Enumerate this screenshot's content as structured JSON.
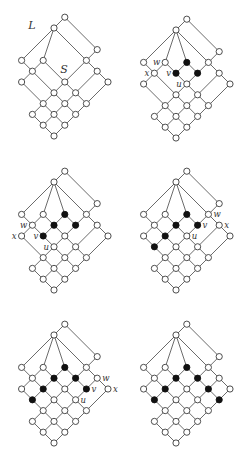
{
  "figure": {
    "diagrams": [
      {
        "id": "panel-1",
        "region_labels": [
          {
            "text": "L",
            "target": "lattice"
          },
          {
            "text": "S",
            "target": "interval"
          }
        ],
        "nodes": [
          {
            "id": "6,5",
            "filled": false
          },
          {
            "id": "5,5",
            "filled": false
          },
          {
            "id": "6,2",
            "filled": false
          },
          {
            "id": "2,5",
            "filled": false
          },
          {
            "id": "3,4",
            "filled": false
          },
          {
            "id": "5,2",
            "filled": false
          },
          {
            "id": "2,4",
            "filled": false
          },
          {
            "id": "5,1",
            "filled": false
          },
          {
            "id": "1,4",
            "filled": false
          },
          {
            "id": "3,2",
            "filled": false
          },
          {
            "id": "5,0",
            "filled": false
          },
          {
            "id": "2,2",
            "filled": false
          },
          {
            "id": "3,1",
            "filled": false
          },
          {
            "id": "1,2",
            "filled": false
          },
          {
            "id": "2,1",
            "filled": false
          },
          {
            "id": "3,0",
            "filled": false
          },
          {
            "id": "0,2",
            "filled": false
          },
          {
            "id": "1,1",
            "filled": false
          },
          {
            "id": "2,0",
            "filled": false
          },
          {
            "id": "0,1",
            "filled": false
          },
          {
            "id": "1,0",
            "filled": false
          },
          {
            "id": "0,0",
            "filled": false
          }
        ],
        "extra_edges": [
          [
            "5,5",
            "3,4"
          ]
        ],
        "node_labels": []
      },
      {
        "id": "panel-2",
        "region_labels": [],
        "nodes": [
          {
            "id": "6,5",
            "filled": false
          },
          {
            "id": "5,5",
            "filled": false
          },
          {
            "id": "6,2",
            "filled": false
          },
          {
            "id": "2,5",
            "filled": false
          },
          {
            "id": "3,4",
            "filled": false
          },
          {
            "id": "4,3",
            "filled": true
          },
          {
            "id": "5,2",
            "filled": false
          },
          {
            "id": "2,4",
            "filled": false
          },
          {
            "id": "3,3",
            "filled": true
          },
          {
            "id": "4,2",
            "filled": true
          },
          {
            "id": "5,1",
            "filled": false
          },
          {
            "id": "1,4",
            "filled": false
          },
          {
            "id": "3,2",
            "filled": false
          },
          {
            "id": "5,0",
            "filled": false
          },
          {
            "id": "2,2",
            "filled": false
          },
          {
            "id": "3,1",
            "filled": false
          },
          {
            "id": "1,2",
            "filled": false
          },
          {
            "id": "2,1",
            "filled": false
          },
          {
            "id": "3,0",
            "filled": false
          },
          {
            "id": "0,2",
            "filled": false
          },
          {
            "id": "1,1",
            "filled": false
          },
          {
            "id": "2,0",
            "filled": false
          },
          {
            "id": "0,1",
            "filled": false
          },
          {
            "id": "1,0",
            "filled": false
          },
          {
            "id": "0,0",
            "filled": false
          }
        ],
        "extra_edges": [
          [
            "5,5",
            "3,4"
          ],
          [
            "5,5",
            "4,3"
          ]
        ],
        "node_labels": [
          {
            "text": "w",
            "node": "3,4"
          },
          {
            "text": "x",
            "node": "2,4"
          },
          {
            "text": "v",
            "node": "3,3"
          },
          {
            "text": "u",
            "node": "3,2"
          }
        ]
      },
      {
        "id": "panel-3",
        "region_labels": [],
        "nodes": [
          {
            "id": "6,5",
            "filled": false
          },
          {
            "id": "5,5",
            "filled": false
          },
          {
            "id": "6,2",
            "filled": false
          },
          {
            "id": "2,5",
            "filled": false
          },
          {
            "id": "3,4",
            "filled": false
          },
          {
            "id": "4,3",
            "filled": true
          },
          {
            "id": "5,2",
            "filled": false
          },
          {
            "id": "2,4",
            "filled": false
          },
          {
            "id": "3,3",
            "filled": true
          },
          {
            "id": "4,2",
            "filled": true
          },
          {
            "id": "5,1",
            "filled": false
          },
          {
            "id": "1,4",
            "filled": false
          },
          {
            "id": "2,3",
            "filled": true
          },
          {
            "id": "3,2",
            "filled": false
          },
          {
            "id": "5,0",
            "filled": false
          },
          {
            "id": "2,2",
            "filled": false
          },
          {
            "id": "3,1",
            "filled": false
          },
          {
            "id": "1,2",
            "filled": false
          },
          {
            "id": "2,1",
            "filled": false
          },
          {
            "id": "3,0",
            "filled": false
          },
          {
            "id": "0,2",
            "filled": false
          },
          {
            "id": "1,1",
            "filled": false
          },
          {
            "id": "2,0",
            "filled": false
          },
          {
            "id": "0,1",
            "filled": false
          },
          {
            "id": "1,0",
            "filled": false
          },
          {
            "id": "0,0",
            "filled": false
          }
        ],
        "extra_edges": [
          [
            "5,5",
            "3,4"
          ],
          [
            "5,5",
            "4,3"
          ]
        ],
        "node_labels": [
          {
            "text": "w",
            "node": "2,4"
          },
          {
            "text": "x",
            "node": "1,4"
          },
          {
            "text": "v",
            "node": "2,3"
          },
          {
            "text": "u",
            "node": "2,2"
          }
        ]
      },
      {
        "id": "panel-4",
        "region_labels": [],
        "nodes": [
          {
            "id": "6,5",
            "filled": false
          },
          {
            "id": "5,5",
            "filled": false
          },
          {
            "id": "6,2",
            "filled": false
          },
          {
            "id": "2,5",
            "filled": false
          },
          {
            "id": "3,4",
            "filled": false
          },
          {
            "id": "4,3",
            "filled": true
          },
          {
            "id": "5,2",
            "filled": false
          },
          {
            "id": "2,4",
            "filled": false
          },
          {
            "id": "3,3",
            "filled": true
          },
          {
            "id": "4,2",
            "filled": true
          },
          {
            "id": "5,1",
            "filled": false
          },
          {
            "id": "1,4",
            "filled": false
          },
          {
            "id": "2,3",
            "filled": true
          },
          {
            "id": "3,2",
            "filled": false
          },
          {
            "id": "5,0",
            "filled": false
          },
          {
            "id": "1,3",
            "filled": true
          },
          {
            "id": "2,2",
            "filled": false
          },
          {
            "id": "3,1",
            "filled": false
          },
          {
            "id": "1,2",
            "filled": false
          },
          {
            "id": "2,1",
            "filled": false
          },
          {
            "id": "3,0",
            "filled": false
          },
          {
            "id": "0,2",
            "filled": false
          },
          {
            "id": "1,1",
            "filled": false
          },
          {
            "id": "2,0",
            "filled": false
          },
          {
            "id": "0,1",
            "filled": false
          },
          {
            "id": "1,0",
            "filled": false
          },
          {
            "id": "0,0",
            "filled": false
          }
        ],
        "extra_edges": [
          [
            "5,5",
            "3,4"
          ],
          [
            "5,5",
            "4,3"
          ]
        ],
        "node_labels": [
          {
            "text": "w",
            "node": "5,2"
          },
          {
            "text": "v",
            "node": "4,2"
          },
          {
            "text": "x",
            "node": "5,1"
          },
          {
            "text": "u",
            "node": "3,2"
          }
        ]
      },
      {
        "id": "panel-5",
        "region_labels": [],
        "nodes": [
          {
            "id": "6,5",
            "filled": false
          },
          {
            "id": "5,5",
            "filled": false
          },
          {
            "id": "6,2",
            "filled": false
          },
          {
            "id": "2,5",
            "filled": false
          },
          {
            "id": "3,4",
            "filled": false
          },
          {
            "id": "4,3",
            "filled": true
          },
          {
            "id": "5,2",
            "filled": false
          },
          {
            "id": "2,4",
            "filled": false
          },
          {
            "id": "3,3",
            "filled": true
          },
          {
            "id": "4,2",
            "filled": true
          },
          {
            "id": "5,1",
            "filled": false
          },
          {
            "id": "1,4",
            "filled": false
          },
          {
            "id": "2,3",
            "filled": true
          },
          {
            "id": "3,2",
            "filled": false
          },
          {
            "id": "4,1",
            "filled": true
          },
          {
            "id": "5,0",
            "filled": false
          },
          {
            "id": "1,3",
            "filled": true
          },
          {
            "id": "2,2",
            "filled": false
          },
          {
            "id": "3,1",
            "filled": false
          },
          {
            "id": "1,2",
            "filled": false
          },
          {
            "id": "2,1",
            "filled": false
          },
          {
            "id": "3,0",
            "filled": false
          },
          {
            "id": "0,2",
            "filled": false
          },
          {
            "id": "1,1",
            "filled": false
          },
          {
            "id": "2,0",
            "filled": false
          },
          {
            "id": "0,1",
            "filled": false
          },
          {
            "id": "1,0",
            "filled": false
          },
          {
            "id": "0,0",
            "filled": false
          }
        ],
        "extra_edges": [
          [
            "5,5",
            "3,4"
          ],
          [
            "5,5",
            "4,3"
          ]
        ],
        "node_labels": [
          {
            "text": "w",
            "node": "5,1"
          },
          {
            "text": "v",
            "node": "4,1"
          },
          {
            "text": "x",
            "node": "5,0"
          },
          {
            "text": "u",
            "node": "3,1"
          }
        ]
      },
      {
        "id": "panel-6",
        "region_labels": [],
        "nodes": [
          {
            "id": "6,5",
            "filled": false
          },
          {
            "id": "5,5",
            "filled": false
          },
          {
            "id": "6,2",
            "filled": false
          },
          {
            "id": "2,5",
            "filled": false
          },
          {
            "id": "3,4",
            "filled": false
          },
          {
            "id": "4,3",
            "filled": true
          },
          {
            "id": "5,2",
            "filled": false
          },
          {
            "id": "2,4",
            "filled": false
          },
          {
            "id": "3,3",
            "filled": true
          },
          {
            "id": "4,2",
            "filled": true
          },
          {
            "id": "5,1",
            "filled": false
          },
          {
            "id": "1,4",
            "filled": false
          },
          {
            "id": "2,3",
            "filled": true
          },
          {
            "id": "3,2",
            "filled": false
          },
          {
            "id": "4,1",
            "filled": true
          },
          {
            "id": "5,0",
            "filled": false
          },
          {
            "id": "1,3",
            "filled": true
          },
          {
            "id": "2,2",
            "filled": false
          },
          {
            "id": "3,1",
            "filled": false
          },
          {
            "id": "4,0",
            "filled": true
          },
          {
            "id": "1,2",
            "filled": false
          },
          {
            "id": "2,1",
            "filled": false
          },
          {
            "id": "3,0",
            "filled": false
          },
          {
            "id": "0,2",
            "filled": false
          },
          {
            "id": "1,1",
            "filled": false
          },
          {
            "id": "2,0",
            "filled": false
          },
          {
            "id": "0,1",
            "filled": false
          },
          {
            "id": "1,0",
            "filled": false
          },
          {
            "id": "0,0",
            "filled": false
          }
        ],
        "extra_edges": [
          [
            "5,5",
            "3,4"
          ],
          [
            "5,5",
            "4,3"
          ]
        ],
        "node_labels": []
      }
    ]
  }
}
